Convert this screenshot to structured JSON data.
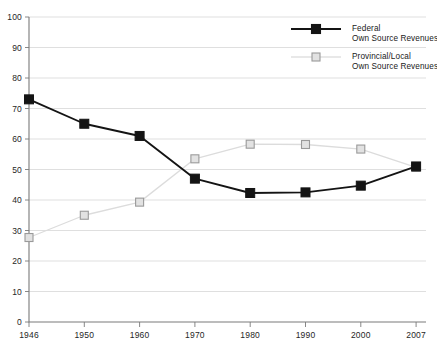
{
  "chart_data": {
    "type": "line",
    "title": "",
    "subtitle": "",
    "xlabel": "",
    "ylabel": "",
    "categories": [
      "1946",
      "1950",
      "1960",
      "1970",
      "1980",
      "1990",
      "2000",
      "2007"
    ],
    "ylim": [
      0,
      100
    ],
    "yticks": [
      0,
      10,
      20,
      30,
      40,
      50,
      60,
      70,
      80,
      90,
      100
    ],
    "ytick_labels": [
      "0",
      "10",
      "20",
      "30",
      "40",
      "50",
      "60",
      "70",
      "80",
      "90",
      "100"
    ],
    "grid": "horizontal",
    "legend_position": "top-right",
    "series": [
      {
        "name": "Federal Own Source Revenues",
        "legend_line1": "Federal",
        "legend_line2": "Own Source Revenues",
        "color": "#141414",
        "marker": "filled-square",
        "values": [
          73,
          65,
          61,
          47,
          42.3,
          42.5,
          44.7,
          51
        ]
      },
      {
        "name": "Provincial/Local Own Source Revenues",
        "legend_line1": "Provincial/Local",
        "legend_line2": "Own Source Revenues",
        "color": "#dcdcdc",
        "marker_fill": "#e2e2e2",
        "marker_stroke": "#9a9a9a",
        "marker": "open-square",
        "values": [
          27.7,
          35,
          39.3,
          53.5,
          58.3,
          58.2,
          56.7,
          50.7
        ]
      }
    ]
  },
  "axes": {
    "axis_color": "#7a7a7a",
    "gridline_color": "#c9c9c9"
  },
  "legend": {
    "entries": [
      {
        "line1": "Federal",
        "line2": "Own Source Revenues"
      },
      {
        "line1": "Provincial/Local",
        "line2": "Own Source Revenues"
      }
    ]
  }
}
